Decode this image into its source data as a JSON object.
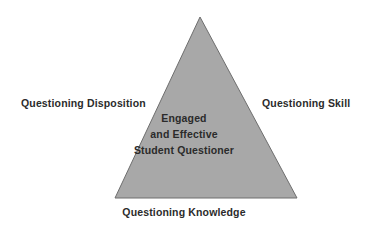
{
  "diagram": {
    "type": "triangle-framework",
    "background_color": "#ffffff",
    "shape": {
      "name": "triangle",
      "fill_color": "#a8a8a8",
      "stroke_color": "#6e6e6e",
      "apex": {
        "x": 200,
        "y": 17
      },
      "bottom_left": {
        "x": 115,
        "y": 198
      },
      "bottom_right": {
        "x": 297,
        "y": 198
      }
    },
    "text_color": "#2b2b2b",
    "edge_labels": {
      "left": "Questioning Disposition",
      "right": "Questioning Skill",
      "bottom": "Questioning Knowledge"
    },
    "center_caption": {
      "lines": [
        "Engaged",
        "and Effective",
        "Student Questioner"
      ]
    }
  }
}
